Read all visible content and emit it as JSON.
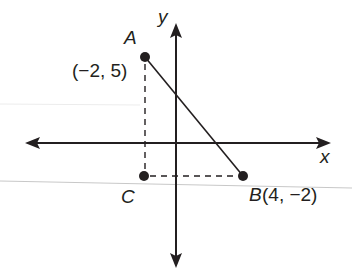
{
  "diagram": {
    "type": "coordinate-plane",
    "axes": {
      "x_label": "x",
      "y_label": "y"
    },
    "points": [
      {
        "name": "A",
        "label": "A",
        "coords_label": "(−2, 5)",
        "x": -2,
        "y": 5
      },
      {
        "name": "B",
        "label": "B",
        "coords_label": "(4, −2)",
        "x": 4,
        "y": -2
      },
      {
        "name": "C",
        "label": "C"
      }
    ],
    "segments": [
      {
        "from": "A",
        "to": "B",
        "style": "solid"
      },
      {
        "from": "A",
        "to": "C",
        "style": "dashed"
      },
      {
        "from": "C",
        "to": "B",
        "style": "dashed"
      }
    ],
    "colors": {
      "ink": "#231f20",
      "background": "#ffffff",
      "scan_line": "#c8c8c8"
    }
  }
}
